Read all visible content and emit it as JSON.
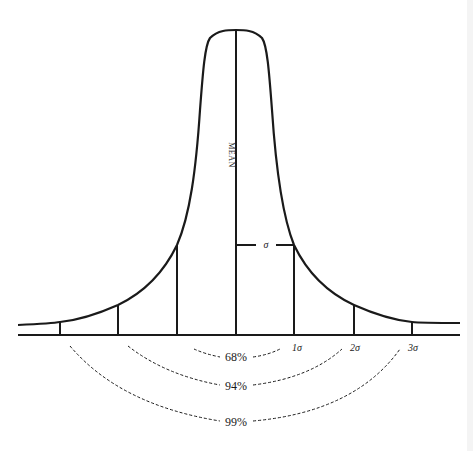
{
  "diagram": {
    "colors": {
      "ink": "#1a1a1a",
      "background": "#ffffff"
    },
    "mean_label": "MEAN",
    "sigma_label": "σ",
    "sigma_ticks": [
      {
        "label": "1σ"
      },
      {
        "label": "2σ"
      },
      {
        "label": "3σ"
      }
    ],
    "ranges": [
      {
        "label": "68%",
        "span": "±1σ"
      },
      {
        "label": "94%",
        "span": "±2σ"
      },
      {
        "label": "99%",
        "span": "±3σ"
      }
    ]
  }
}
